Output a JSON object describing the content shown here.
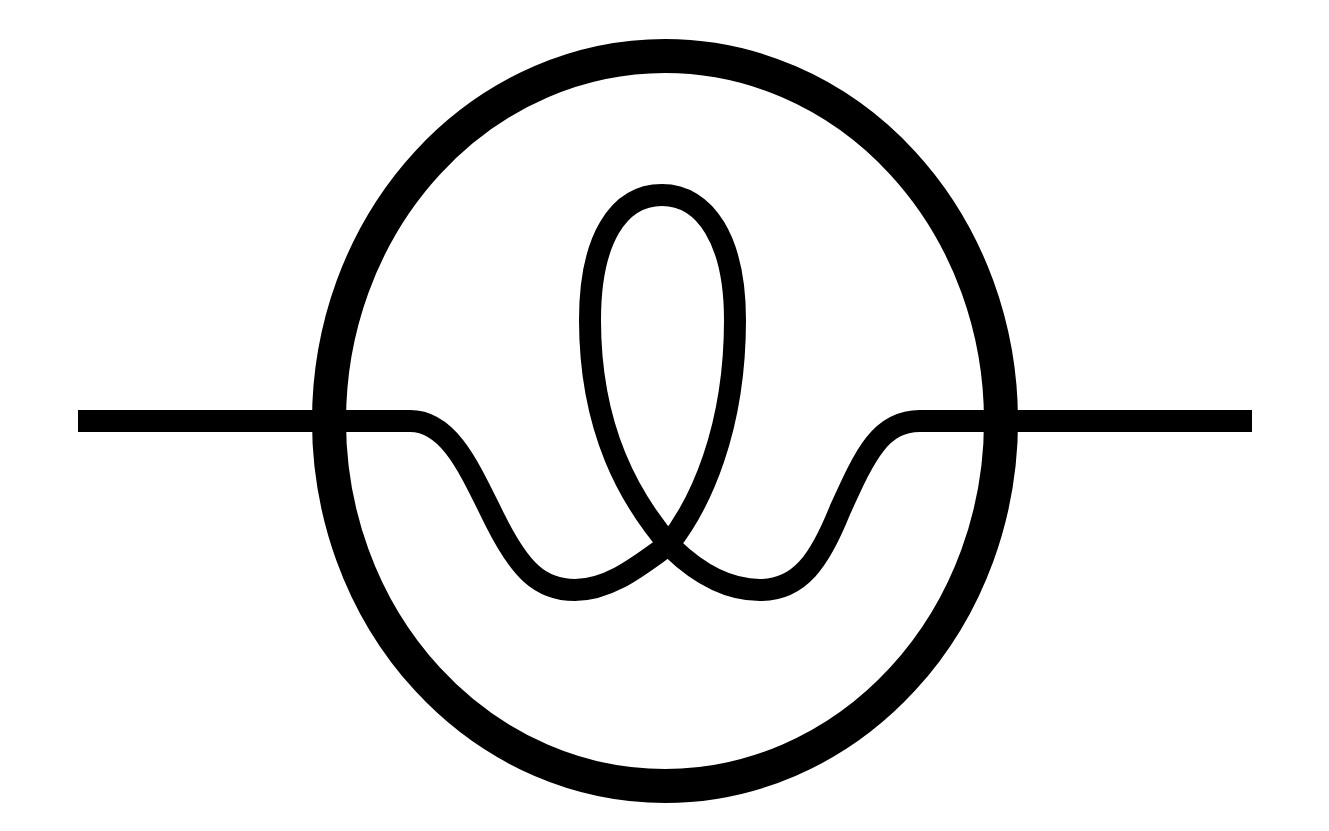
{
  "diagram": {
    "type": "symbol",
    "colors": {
      "background": "#ffffff",
      "stroke": "#000000"
    },
    "circle": {
      "cx": 665,
      "cy": 421,
      "rx": 336,
      "ry": 365,
      "stroke_width": 34
    },
    "line": {
      "y": 421,
      "x_start": 78,
      "x_end": 1252,
      "stroke_width": 22
    },
    "loop": {
      "top_y": 195,
      "cross_x": 672,
      "cross_y": 547,
      "bottom_y": 590
    }
  }
}
